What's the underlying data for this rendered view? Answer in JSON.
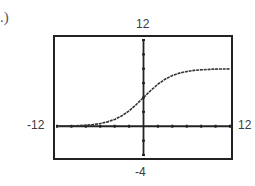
{
  "figure": {
    "part_label": ".)",
    "window": {
      "xmin_label": "-12",
      "xmax_label": "12",
      "ymin_label": "-4",
      "ymax_label": "12"
    }
  },
  "chart_data": {
    "type": "line",
    "title": "",
    "xlabel": "",
    "ylabel": "",
    "xlim": [
      -12,
      12
    ],
    "ylim": [
      -4,
      12
    ],
    "x_tick_step": 2,
    "y_tick_step": 2,
    "grid": false,
    "legend": null,
    "annotations": [
      "-12",
      "12",
      "-4",
      "12"
    ],
    "series": [
      {
        "name": "f(x) ≈ 8/(1+e^(-0.5x))",
        "x": [
          -12,
          -10,
          -8,
          -7,
          -6,
          -5,
          -4,
          -3,
          -2,
          -1,
          0,
          1,
          2,
          3,
          4,
          5,
          6,
          7,
          8,
          10,
          12
        ],
        "y": [
          0.02,
          0.05,
          0.14,
          0.23,
          0.38,
          0.61,
          0.95,
          1.46,
          2.15,
          3.02,
          4.0,
          4.98,
          5.85,
          6.54,
          7.05,
          7.39,
          7.62,
          7.77,
          7.86,
          7.95,
          7.98
        ]
      }
    ]
  }
}
